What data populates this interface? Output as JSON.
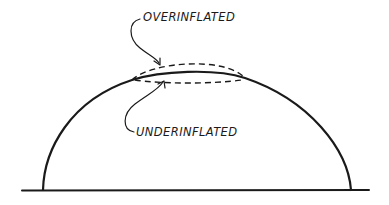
{
  "diagram": {
    "type": "cross-section sketch",
    "labels": {
      "overinflated": "OVERINFLATED",
      "underinflated": "UNDERINFLATED"
    },
    "elements": [
      {
        "id": "ground-line",
        "description": "horizontal ground baseline"
      },
      {
        "id": "dome-profile",
        "description": "solid curve showing normal inflated dome"
      },
      {
        "id": "overinflated-profile",
        "description": "dashed curve above dome crown"
      },
      {
        "id": "underinflated-profile",
        "description": "dashed curve below dome crown"
      },
      {
        "id": "overinflated-leader",
        "description": "curved arrow from OVERINFLATED label to upper dashed curve"
      },
      {
        "id": "underinflated-leader",
        "description": "curved arrow from UNDERINFLATED label to lower dashed curve"
      }
    ],
    "colors": {
      "ink": "#1a1a1a",
      "background": "#ffffff"
    }
  }
}
